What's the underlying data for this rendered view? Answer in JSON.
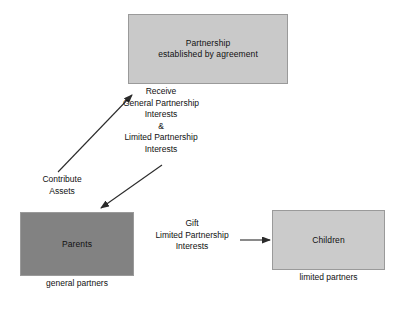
{
  "diagram": {
    "nodes": {
      "partnership": {
        "label": "Partnership\nestablished by agreement",
        "fill": "#c9c9c9"
      },
      "parents": {
        "label": "Parents",
        "caption": "general partners",
        "fill": "#828282"
      },
      "children": {
        "label": "Children",
        "caption": "limited partners",
        "fill": "#cbcbcb"
      }
    },
    "edges": {
      "contribute": {
        "label": "Contribute\nAssets",
        "direction": "parents-to-partnership"
      },
      "receive": {
        "label": "Receive\nGeneral Partnership\nInterests\n&\nLimited Partnership\nInterests",
        "direction": "partnership-to-parents"
      },
      "gift": {
        "label": "Gift\nLimited Partnership\nInterests",
        "direction": "parents-to-children"
      }
    },
    "stroke_color": "#2b2b2b",
    "border_color": "#9a9a9a",
    "background": "#ffffff"
  }
}
